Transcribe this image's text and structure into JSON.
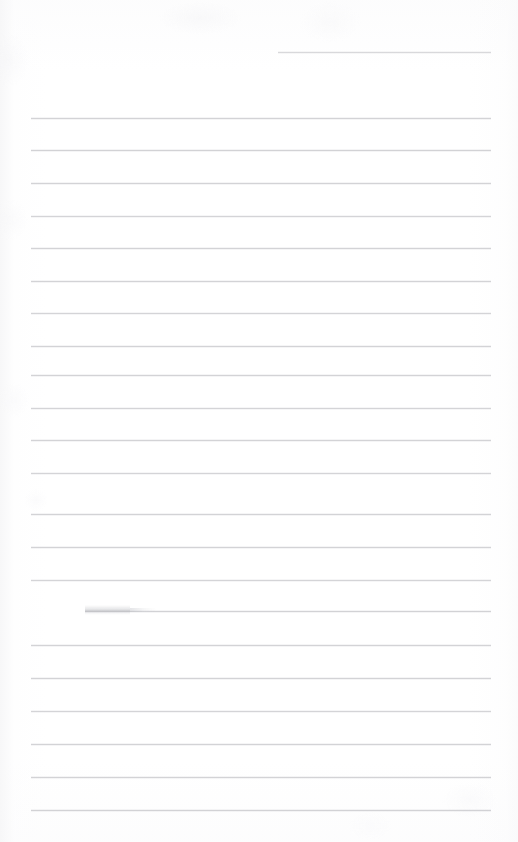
{
  "document": {
    "kind": "scanned-ruled-notebook-page",
    "title": "Blank Lined Notebook Page",
    "page_width_px": 518,
    "page_height_px": 842,
    "background_color": "#ffffff",
    "rule_color": "#c9cace",
    "rule_thickness_px": 1,
    "rule_spacing_px": 32.6,
    "content_text": "",
    "handwriting_present": "no",
    "notes_visible_on_page": "none"
  },
  "ruled_lines": [
    {
      "index": 1,
      "y": 52,
      "x_start": 278,
      "x_end": 491,
      "opacity": 0.7,
      "label": "header-rule-short"
    },
    {
      "index": 2,
      "y": 118,
      "x_start": 31,
      "x_end": 491,
      "opacity": 0.8,
      "label": "rule"
    },
    {
      "index": 3,
      "y": 150,
      "x_start": 31,
      "x_end": 491,
      "opacity": 0.82,
      "label": "rule"
    },
    {
      "index": 4,
      "y": 183,
      "x_start": 31,
      "x_end": 491,
      "opacity": 0.8,
      "label": "rule"
    },
    {
      "index": 5,
      "y": 216,
      "x_start": 31,
      "x_end": 491,
      "opacity": 0.78,
      "label": "rule"
    },
    {
      "index": 6,
      "y": 248,
      "x_start": 31,
      "x_end": 491,
      "opacity": 0.8,
      "label": "rule"
    },
    {
      "index": 7,
      "y": 281,
      "x_start": 31,
      "x_end": 491,
      "opacity": 0.8,
      "label": "rule"
    },
    {
      "index": 8,
      "y": 313,
      "x_start": 31,
      "x_end": 491,
      "opacity": 0.78,
      "label": "rule"
    },
    {
      "index": 9,
      "y": 346,
      "x_start": 31,
      "x_end": 491,
      "opacity": 0.8,
      "label": "rule"
    },
    {
      "index": 10,
      "y": 375,
      "x_start": 31,
      "x_end": 491,
      "opacity": 0.8,
      "label": "rule"
    },
    {
      "index": 11,
      "y": 408,
      "x_start": 31,
      "x_end": 491,
      "opacity": 0.78,
      "label": "rule"
    },
    {
      "index": 12,
      "y": 440,
      "x_start": 31,
      "x_end": 491,
      "opacity": 0.8,
      "label": "rule"
    },
    {
      "index": 13,
      "y": 473,
      "x_start": 31,
      "x_end": 491,
      "opacity": 0.78,
      "label": "rule"
    },
    {
      "index": 14,
      "y": 514,
      "x_start": 31,
      "x_end": 491,
      "opacity": 0.8,
      "label": "rule"
    },
    {
      "index": 15,
      "y": 547,
      "x_start": 31,
      "x_end": 491,
      "opacity": 0.8,
      "label": "rule"
    },
    {
      "index": 16,
      "y": 580,
      "x_start": 31,
      "x_end": 491,
      "opacity": 0.78,
      "label": "rule"
    },
    {
      "index": 17,
      "y": 611,
      "x_start": 85,
      "x_end": 491,
      "opacity": 0.82,
      "label": "rule-with-erased-mark"
    },
    {
      "index": 18,
      "y": 645,
      "x_start": 31,
      "x_end": 491,
      "opacity": 0.8,
      "label": "rule"
    },
    {
      "index": 19,
      "y": 678,
      "x_start": 31,
      "x_end": 491,
      "opacity": 0.8,
      "label": "rule"
    },
    {
      "index": 20,
      "y": 711,
      "x_start": 31,
      "x_end": 491,
      "opacity": 0.78,
      "label": "rule"
    },
    {
      "index": 21,
      "y": 744,
      "x_start": 31,
      "x_end": 491,
      "opacity": 0.8,
      "label": "rule"
    },
    {
      "index": 22,
      "y": 777,
      "x_start": 31,
      "x_end": 491,
      "opacity": 0.8,
      "label": "rule"
    },
    {
      "index": 23,
      "y": 810,
      "x_start": 31,
      "x_end": 491,
      "opacity": 0.82,
      "label": "rule"
    }
  ],
  "marks": {
    "erased_pencil_smudge": {
      "description": "faint gray erased-pencil smudge",
      "x": 85,
      "y": 605,
      "width": 45,
      "height": 10,
      "tail_x": 130,
      "tail_y": 608,
      "tail_width": 26,
      "tail_height": 4,
      "color": "#a2a4ab"
    }
  }
}
